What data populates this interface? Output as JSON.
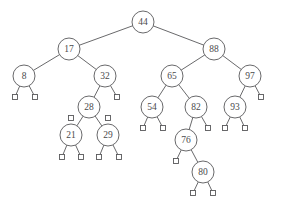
{
  "figure": {
    "name": "binary-search-tree-diagram",
    "background_color": "#ffffff",
    "stroke_color": "#58585a",
    "node_fill_color": "#ffffff",
    "text_color": "#4a4a4c",
    "node_radius": 11,
    "leaf_size": 5,
    "font_size": 9.5
  },
  "nodes": [
    {
      "id": "n44",
      "label": "44",
      "x": 143,
      "y": 22
    },
    {
      "id": "n17",
      "label": "17",
      "x": 69,
      "y": 49
    },
    {
      "id": "n88",
      "label": "88",
      "x": 214,
      "y": 49
    },
    {
      "id": "n8",
      "label": "8",
      "x": 24,
      "y": 76
    },
    {
      "id": "n32",
      "label": "32",
      "x": 105,
      "y": 76
    },
    {
      "id": "n65",
      "label": "65",
      "x": 172,
      "y": 76
    },
    {
      "id": "n97",
      "label": "97",
      "x": 250,
      "y": 76
    },
    {
      "id": "n28",
      "label": "28",
      "x": 89,
      "y": 107
    },
    {
      "id": "n54",
      "label": "54",
      "x": 152,
      "y": 107
    },
    {
      "id": "n82",
      "label": "82",
      "x": 196,
      "y": 107
    },
    {
      "id": "n93",
      "label": "93",
      "x": 235,
      "y": 107
    },
    {
      "id": "n21",
      "label": "21",
      "x": 71,
      "y": 135
    },
    {
      "id": "n29",
      "label": "29",
      "x": 108,
      "y": 135
    },
    {
      "id": "n76",
      "label": "76",
      "x": 186,
      "y": 140
    },
    {
      "id": "n80",
      "label": "80",
      "x": 203,
      "y": 172
    }
  ],
  "leaves": [
    {
      "id": "l8L",
      "x": 15,
      "y": 97
    },
    {
      "id": "l8R",
      "x": 35,
      "y": 97
    },
    {
      "id": "l32R",
      "x": 117,
      "y": 97
    },
    {
      "id": "l28L",
      "x": 71,
      "y": 118
    },
    {
      "id": "l28R",
      "x": 108,
      "y": 118
    },
    {
      "id": "l54L",
      "x": 143,
      "y": 128
    },
    {
      "id": "l54R",
      "x": 163,
      "y": 128
    },
    {
      "id": "l82R",
      "x": 208,
      "y": 128
    },
    {
      "id": "l93L",
      "x": 225,
      "y": 128
    },
    {
      "id": "l93R",
      "x": 245,
      "y": 128
    },
    {
      "id": "l97R",
      "x": 261,
      "y": 97
    },
    {
      "id": "l21L",
      "x": 62,
      "y": 157
    },
    {
      "id": "l21R",
      "x": 81,
      "y": 157
    },
    {
      "id": "l29L",
      "x": 99,
      "y": 157
    },
    {
      "id": "l29R",
      "x": 119,
      "y": 157
    },
    {
      "id": "l76L",
      "x": 176,
      "y": 161
    },
    {
      "id": "l80L",
      "x": 193,
      "y": 193
    },
    {
      "id": "l80R",
      "x": 213,
      "y": 193
    }
  ],
  "edges": [
    {
      "from": "n44",
      "to": "n17"
    },
    {
      "from": "n44",
      "to": "n88"
    },
    {
      "from": "n17",
      "to": "n8"
    },
    {
      "from": "n17",
      "to": "n32"
    },
    {
      "from": "n88",
      "to": "n65"
    },
    {
      "from": "n88",
      "to": "n97"
    },
    {
      "from": "n8",
      "to": "l8L"
    },
    {
      "from": "n8",
      "to": "l8R"
    },
    {
      "from": "n32",
      "to": "n28"
    },
    {
      "from": "n32",
      "to": "l32R"
    },
    {
      "from": "n65",
      "to": "n54"
    },
    {
      "from": "n65",
      "to": "n82"
    },
    {
      "from": "n97",
      "to": "n93"
    },
    {
      "from": "n97",
      "to": "l97R"
    },
    {
      "from": "n28",
      "to": "n21"
    },
    {
      "from": "n28",
      "to": "n29"
    },
    {
      "from": "n54",
      "to": "l54L"
    },
    {
      "from": "n54",
      "to": "l54R"
    },
    {
      "from": "n82",
      "to": "n76"
    },
    {
      "from": "n82",
      "to": "l82R"
    },
    {
      "from": "n93",
      "to": "l93L"
    },
    {
      "from": "n93",
      "to": "l93R"
    },
    {
      "from": "n21",
      "to": "l21L"
    },
    {
      "from": "n21",
      "to": "l21R"
    },
    {
      "from": "n29",
      "to": "l29L"
    },
    {
      "from": "n29",
      "to": "l29R"
    },
    {
      "from": "n76",
      "to": "l76L"
    },
    {
      "from": "n76",
      "to": "n80"
    },
    {
      "from": "n80",
      "to": "l80L"
    },
    {
      "from": "n80",
      "to": "l80R"
    }
  ]
}
